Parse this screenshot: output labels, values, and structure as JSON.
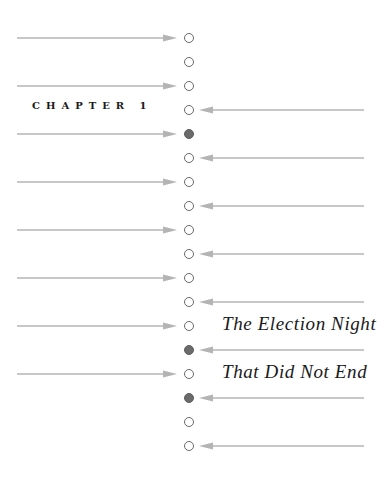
{
  "chapter": {
    "label": "CHAPTER 1",
    "title_lines": [
      "The Election Night",
      "That Did Not End"
    ]
  },
  "colors": {
    "arrow": "#b4b4b4",
    "dot_outline": "#6a6a6a",
    "dot_filled": "#6b6b6b",
    "text": "#1a1a1a"
  },
  "rows": [
    {
      "index": 0,
      "dot": "open",
      "arrow": "in"
    },
    {
      "index": 1,
      "dot": "open",
      "arrow": "none"
    },
    {
      "index": 2,
      "dot": "open",
      "arrow": "in"
    },
    {
      "index": 3,
      "dot": "open",
      "arrow": "out"
    },
    {
      "index": 4,
      "dot": "filled",
      "arrow": "in"
    },
    {
      "index": 5,
      "dot": "open",
      "arrow": "out"
    },
    {
      "index": 6,
      "dot": "open",
      "arrow": "in"
    },
    {
      "index": 7,
      "dot": "open",
      "arrow": "out"
    },
    {
      "index": 8,
      "dot": "open",
      "arrow": "in"
    },
    {
      "index": 9,
      "dot": "open",
      "arrow": "out"
    },
    {
      "index": 10,
      "dot": "open",
      "arrow": "in"
    },
    {
      "index": 11,
      "dot": "open",
      "arrow": "out"
    },
    {
      "index": 12,
      "dot": "open",
      "arrow": "in"
    },
    {
      "index": 13,
      "dot": "filled",
      "arrow": "out"
    },
    {
      "index": 14,
      "dot": "open",
      "arrow": "in"
    },
    {
      "index": 15,
      "dot": "filled",
      "arrow": "out"
    },
    {
      "index": 16,
      "dot": "open",
      "arrow": "none"
    },
    {
      "index": 17,
      "dot": "open",
      "arrow": "out"
    }
  ]
}
